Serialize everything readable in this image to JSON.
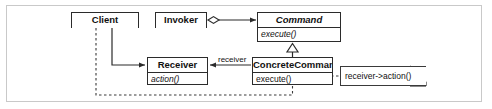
{
  "diagram": {
    "type": "uml-class-diagram",
    "background": "#ffffff",
    "frame_color": "#c9c9c9",
    "line_color": "#2b2b2b"
  },
  "classes": {
    "client": {
      "name": "Client",
      "abstract": false,
      "operations": [],
      "x": 71,
      "y": 12,
      "w": 68,
      "h": 16
    },
    "invoker": {
      "name": "Invoker",
      "abstract": false,
      "operations": [],
      "x": 155,
      "y": 12,
      "w": 52,
      "h": 16
    },
    "command": {
      "name": "Command",
      "abstract": true,
      "operations": [
        "execute()"
      ],
      "x": 257,
      "y": 12,
      "w": 84,
      "h": 30
    },
    "receiver": {
      "name": "Receiver",
      "abstract": false,
      "operations": [
        "action()"
      ],
      "x": 147,
      "y": 57,
      "w": 61,
      "h": 28
    },
    "concrete_command": {
      "name": "ConcreteCommand",
      "abstract": false,
      "operations": [
        "execute()"
      ],
      "x": 252,
      "y": 57,
      "w": 81,
      "h": 28
    }
  },
  "notes": [
    {
      "id": "note-receiver-action",
      "text": "receiver->action()",
      "x": 340,
      "y": 66,
      "w": 86,
      "h": 20
    }
  ],
  "edge_labels": [
    {
      "id": "receiver-role",
      "text": "receiver",
      "x": 218,
      "y": 56
    }
  ],
  "relationships": [
    {
      "from": "invoker",
      "to": "command",
      "type": "aggregation"
    },
    {
      "from": "concrete_command",
      "to": "command",
      "type": "generalization"
    },
    {
      "from": "client",
      "to": "receiver",
      "type": "association"
    },
    {
      "from": "concrete_command",
      "to": "receiver",
      "type": "association",
      "label": "receiver"
    },
    {
      "from": "client",
      "to": "concrete_command",
      "type": "dependency"
    },
    {
      "from": "concrete_command.execute",
      "to": "note-receiver-action",
      "type": "note-anchor"
    }
  ]
}
